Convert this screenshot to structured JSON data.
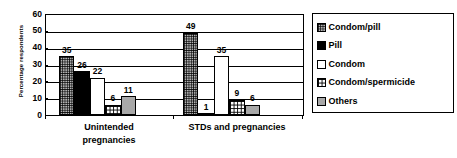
{
  "chart_data": {
    "type": "bar",
    "title": "",
    "xlabel": "",
    "ylabel": "Percentage respondents",
    "ylim": [
      0,
      60
    ],
    "ytick_labels": [
      "60",
      "50",
      "40",
      "30",
      "20",
      "10",
      "0"
    ],
    "ytick_values": [
      60,
      50,
      40,
      30,
      20,
      10,
      0
    ],
    "grid": true,
    "legend_position": "right",
    "categories": [
      "Unintended pregnancies",
      "STDs and pregnancies"
    ],
    "category_lines": [
      [
        "Unintended",
        "pregnancies"
      ],
      [
        "STDs and pregnancies"
      ]
    ],
    "series": [
      {
        "name": "Condom/pill",
        "values": [
          35,
          49
        ],
        "fill": "dotgrid",
        "color": "#b3b3b3"
      },
      {
        "name": "Pill",
        "values": [
          26,
          1
        ],
        "fill": "black",
        "color": "#000000"
      },
      {
        "name": "Condom",
        "values": [
          22,
          35
        ],
        "fill": "white",
        "color": "#ffffff"
      },
      {
        "name": "Condom/spermicide",
        "values": [
          6,
          9
        ],
        "fill": "crosshatch",
        "color": "#ffffff"
      },
      {
        "name": "Others",
        "values": [
          11,
          6
        ],
        "fill": "gray",
        "color": "#a8a8a8"
      }
    ],
    "data_labels": [
      [
        "35",
        "26",
        "22",
        "6",
        "11"
      ],
      [
        "49",
        "1",
        "35",
        "9",
        "6"
      ]
    ]
  },
  "legend": {
    "items": [
      {
        "label": "Condom/pill"
      },
      {
        "label": "Pill"
      },
      {
        "label": "Condom"
      },
      {
        "label": "Condom/spermicide"
      },
      {
        "label": "Others"
      }
    ]
  }
}
